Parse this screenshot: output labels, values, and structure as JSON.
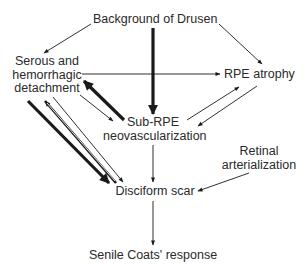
{
  "diagram": {
    "type": "flowchart",
    "nodes": {
      "drusen": {
        "label": "Background of Drusen"
      },
      "serous": {
        "lines": [
          "Serous and",
          "hemorrhagic",
          "detachment"
        ]
      },
      "rpe_atrophy": {
        "label": "RPE atrophy"
      },
      "sub_rpe": {
        "lines": [
          "Sub-RPE",
          "neovascularization"
        ]
      },
      "retinal": {
        "lines": [
          "Retinal",
          "arterialization"
        ]
      },
      "disciform": {
        "label": "Disciform scar"
      },
      "coats": {
        "label": "Senile Coats' response"
      }
    },
    "edges": [
      {
        "from": "Background of Drusen",
        "to": "Serous and hemorrhagic detachment",
        "weight": "thin"
      },
      {
        "from": "Background of Drusen",
        "to": "RPE atrophy",
        "weight": "thin"
      },
      {
        "from": "Background of Drusen",
        "to": "Sub-RPE neovascularization",
        "weight": "thick"
      },
      {
        "from": "Serous and hemorrhagic detachment",
        "to": "RPE atrophy",
        "weight": "thin"
      },
      {
        "from": "Sub-RPE neovascularization",
        "to": "Serous and hemorrhagic detachment",
        "weight": "thick"
      },
      {
        "from": "Serous and hemorrhagic detachment",
        "to": "Sub-RPE neovascularization",
        "weight": "thin"
      },
      {
        "from": "Sub-RPE neovascularization",
        "to": "RPE atrophy",
        "weight": "thin"
      },
      {
        "from": "RPE atrophy",
        "to": "Sub-RPE neovascularization",
        "weight": "thin"
      },
      {
        "from": "Serous and hemorrhagic detachment",
        "to": "Disciform scar",
        "weight": "thick"
      },
      {
        "from": "Disciform scar",
        "to": "Serous and hemorrhagic detachment",
        "weight": "double"
      },
      {
        "from": "Serous and hemorrhagic detachment",
        "to": "Disciform scar",
        "weight": "thin"
      },
      {
        "from": "Sub-RPE neovascularization",
        "to": "Disciform scar",
        "weight": "thin"
      },
      {
        "from": "Retinal arterialization",
        "to": "Disciform scar",
        "weight": "thin"
      },
      {
        "from": "Disciform scar",
        "to": "Senile Coats' response",
        "weight": "thin"
      }
    ],
    "colors": {
      "line": "#1a1a1a",
      "text": "#2a2a2a",
      "background": "#ffffff"
    }
  }
}
